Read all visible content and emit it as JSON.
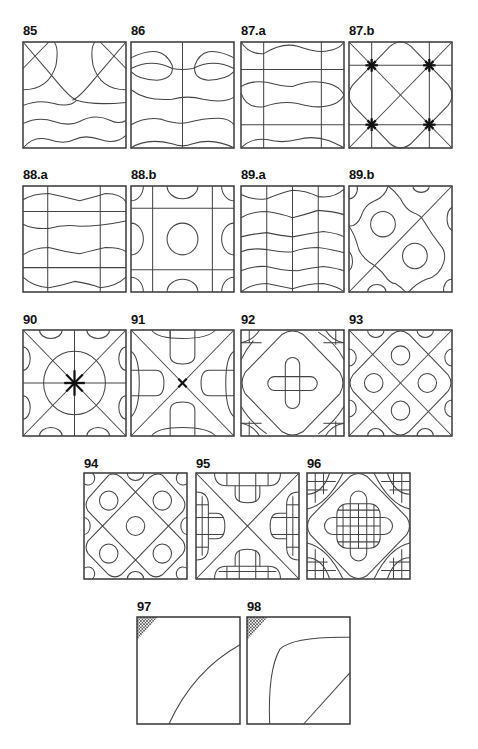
{
  "figure": {
    "panels": [
      {
        "id": "p85",
        "label": "85",
        "x": 23,
        "y": 24,
        "w": 103,
        "h": 106
      },
      {
        "id": "p86",
        "label": "86",
        "x": 131,
        "y": 24,
        "w": 103,
        "h": 106
      },
      {
        "id": "p87a",
        "label": "87.a",
        "x": 241,
        "y": 24,
        "w": 103,
        "h": 106
      },
      {
        "id": "p87b",
        "label": "87.b",
        "x": 349,
        "y": 24,
        "w": 103,
        "h": 106
      },
      {
        "id": "p88a",
        "label": "88.a",
        "x": 23,
        "y": 168,
        "w": 103,
        "h": 106
      },
      {
        "id": "p88b",
        "label": "88.b",
        "x": 131,
        "y": 168,
        "w": 103,
        "h": 106
      },
      {
        "id": "p89a",
        "label": "89.a",
        "x": 241,
        "y": 168,
        "w": 103,
        "h": 106
      },
      {
        "id": "p89b",
        "label": "89.b",
        "x": 349,
        "y": 168,
        "w": 103,
        "h": 106
      },
      {
        "id": "p90",
        "label": "90",
        "x": 23,
        "y": 313,
        "w": 103,
        "h": 106
      },
      {
        "id": "p91",
        "label": "91",
        "x": 131,
        "y": 313,
        "w": 103,
        "h": 106
      },
      {
        "id": "p92",
        "label": "92",
        "x": 241,
        "y": 313,
        "w": 103,
        "h": 106
      },
      {
        "id": "p93",
        "label": "93",
        "x": 349,
        "y": 313,
        "w": 103,
        "h": 106
      },
      {
        "id": "p94",
        "label": "94",
        "x": 84,
        "y": 457,
        "w": 103,
        "h": 106
      },
      {
        "id": "p95",
        "label": "95",
        "x": 196,
        "y": 457,
        "w": 103,
        "h": 106
      },
      {
        "id": "p96",
        "label": "96",
        "x": 307,
        "y": 457,
        "w": 103,
        "h": 106
      },
      {
        "id": "p97",
        "label": "97",
        "x": 137,
        "y": 600,
        "w": 103,
        "h": 106
      },
      {
        "id": "p98",
        "label": "98",
        "x": 247,
        "y": 600,
        "w": 103,
        "h": 106
      }
    ]
  },
  "colors": {
    "line": "#444444",
    "frame": "#333333",
    "hatch": "#555555"
  }
}
